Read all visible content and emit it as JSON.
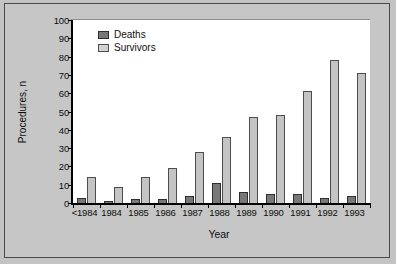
{
  "chart_data": {
    "type": "bar",
    "title": "",
    "xlabel": "Year",
    "ylabel": "Procedures, n",
    "categories": [
      "<1984",
      "1984",
      "1985",
      "1986",
      "1987",
      "1988",
      "1989",
      "1990",
      "1991",
      "1992",
      "1993"
    ],
    "series": [
      {
        "name": "Deaths",
        "color": "#787878",
        "values": [
          3,
          1,
          2,
          2,
          4,
          11,
          6,
          5,
          5,
          3,
          4
        ]
      },
      {
        "name": "Survivors",
        "color": "#c4c4c4",
        "values": [
          14,
          9,
          14,
          19,
          28,
          36,
          47,
          48,
          61,
          78,
          71
        ]
      }
    ],
    "ylim": [
      0,
      100
    ],
    "yticks": [
      0,
      10,
      20,
      30,
      40,
      50,
      60,
      70,
      80,
      90,
      100
    ],
    "ytick_labels": [
      "0",
      "10",
      "20",
      "30",
      "40",
      "50",
      "60",
      "70",
      "80",
      "90",
      "100"
    ],
    "grid": false,
    "legend_position": "top-left",
    "legend": [
      "Deaths",
      "Survivors"
    ],
    "colors": {
      "figure_background": "#c6c6c6",
      "plot_background": "#ffffff",
      "axis": "#000000",
      "deaths": "#787878",
      "survivors": "#c4c4c4"
    }
  }
}
